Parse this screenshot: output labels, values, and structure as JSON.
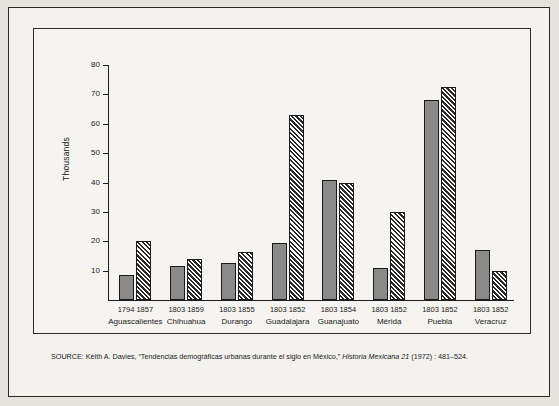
{
  "figure": {
    "y_axis_title": "Thousands",
    "source_note_prefix": "SOURCE: Keith A. Davies, “Tendencias demográficas urbanas durante el siglo en México,” ",
    "source_note_italic": "Historia Mexicana 21",
    "source_note_suffix": " (1972) : 481–524."
  },
  "chart_data": {
    "type": "bar",
    "title": "",
    "xlabel": "",
    "ylabel": "Thousands",
    "ylim": [
      0,
      80
    ],
    "yticks": [
      10,
      20,
      30,
      40,
      50,
      60,
      70,
      80
    ],
    "grid": false,
    "legend": "none",
    "categories": [
      "Aguascalientes",
      "Chihuahua",
      "Durango",
      "Guadalajara",
      "Guanajuato",
      "Mérida",
      "Puebla",
      "Veracruz"
    ],
    "series": [
      {
        "name": "earlier year",
        "style": "solid-gray",
        "color": "#8a8a8a",
        "year_labels": [
          "1794",
          "1803",
          "1803",
          "1803",
          "1803",
          "1803",
          "1803",
          "1803"
        ],
        "values": [
          8.5,
          11.5,
          12.5,
          19.5,
          41,
          11,
          68,
          17
        ]
      },
      {
        "name": "later year",
        "style": "hatched",
        "color": "#ffffff",
        "year_labels": [
          "1857",
          "1859",
          "1855",
          "1852",
          "1854",
          "1852",
          "1852",
          "1852"
        ],
        "values": [
          20,
          14,
          16.5,
          63,
          40,
          30,
          72.5,
          10
        ]
      }
    ]
  }
}
